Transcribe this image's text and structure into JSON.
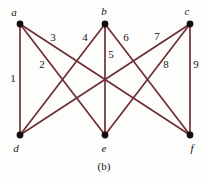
{
  "figure": {
    "caption": "(b)",
    "caption_x": 104,
    "caption_y": 170,
    "background_color": "#fdfdfc",
    "edge_color": "#6e2f34",
    "vertex_color": "#140d10",
    "text_color": "#1a1416"
  },
  "vertices": [
    {
      "id": "a",
      "label": "a",
      "x": 20,
      "y": 24,
      "label_x": 14,
      "label_y": 16
    },
    {
      "id": "b",
      "label": "b",
      "x": 105,
      "y": 24,
      "label_x": 104,
      "label_y": 15
    },
    {
      "id": "c",
      "label": "c",
      "x": 190,
      "y": 24,
      "label_x": 187,
      "label_y": 15
    },
    {
      "id": "d",
      "label": "d",
      "x": 20,
      "y": 135,
      "label_x": 16,
      "label_y": 152
    },
    {
      "id": "e",
      "label": "e",
      "x": 105,
      "y": 135,
      "label_x": 104,
      "label_y": 152
    },
    {
      "id": "f",
      "label": "f",
      "x": 190,
      "y": 135,
      "label_x": 192,
      "label_y": 152
    }
  ],
  "edges": [
    {
      "id": "e1",
      "label": "1",
      "from": "a",
      "to": "d",
      "label_x": 13,
      "label_y": 82
    },
    {
      "id": "e2",
      "label": "2",
      "from": "a",
      "to": "e",
      "label_x": 42,
      "label_y": 68
    },
    {
      "id": "e3",
      "label": "3",
      "from": "a",
      "to": "f",
      "label_x": 53,
      "label_y": 41
    },
    {
      "id": "e4",
      "label": "4",
      "from": "b",
      "to": "d",
      "label_x": 85,
      "label_y": 41
    },
    {
      "id": "e5",
      "label": "5",
      "from": "b",
      "to": "e",
      "label_x": 111,
      "label_y": 58
    },
    {
      "id": "e6",
      "label": "6",
      "from": "b",
      "to": "f",
      "label_x": 126,
      "label_y": 41
    },
    {
      "id": "e7",
      "label": "7",
      "from": "c",
      "to": "d",
      "label_x": 157,
      "label_y": 40
    },
    {
      "id": "e8",
      "label": "8",
      "from": "c",
      "to": "e",
      "label_x": 166,
      "label_y": 68
    },
    {
      "id": "e9",
      "label": "9",
      "from": "c",
      "to": "f",
      "label_x": 196,
      "label_y": 68
    }
  ],
  "graph_meta": {
    "type": "bipartite",
    "top_set": [
      "a",
      "b",
      "c"
    ],
    "bottom_set": [
      "d",
      "e",
      "f"
    ],
    "edge_count": 9,
    "vertex_count": 6
  }
}
